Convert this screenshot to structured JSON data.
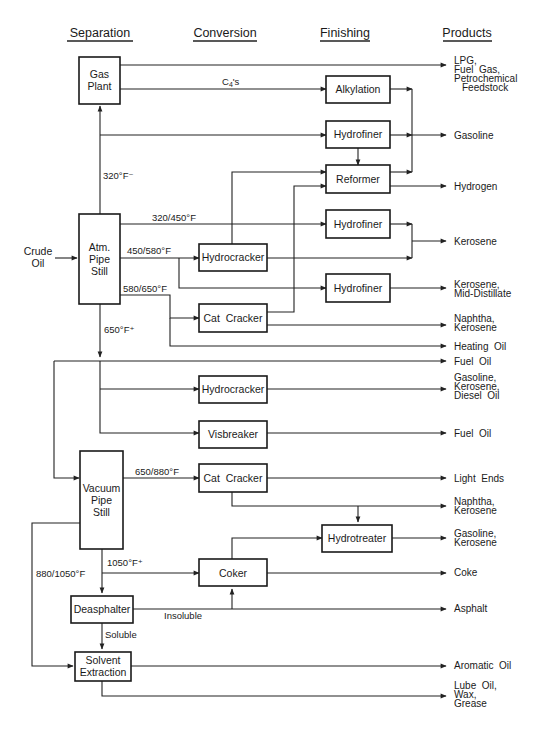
{
  "diagram": {
    "columns": {
      "separation": "Separation",
      "conversion": "Conversion",
      "finishing": "Finishing",
      "products": "Products"
    },
    "feed": {
      "line1": "Crude",
      "line2": "Oil"
    },
    "separation_units": {
      "gas_plant": {
        "line1": "Gas",
        "line2": "Plant"
      },
      "atm_pipe_still": {
        "line1": "Atm.",
        "line2": "Pipe",
        "line3": "Still"
      },
      "vacuum_pipe_still": {
        "line1": "Vacuum",
        "line2": "Pipe",
        "line3": "Still"
      },
      "deasphalter": {
        "label": "Deasphalter"
      },
      "solvent_extraction": {
        "line1": "Solvent",
        "line2": "Extraction"
      }
    },
    "conversion_units": {
      "hydrocracker_1": "Hydrocracker",
      "cat_cracker_1": "Cat  Cracker",
      "hydrocracker_2": "Hydrocracker",
      "visbreaker": "Visbreaker",
      "cat_cracker_2": "Cat  Cracker",
      "coker": "Coker"
    },
    "finishing_units": {
      "alkylation": "Alkylation",
      "hydrofiner_1": "Hydrofiner",
      "reformer": "Reformer",
      "hydrofiner_2": "Hydrofiner",
      "hydrofiner_3": "Hydrofiner",
      "hydrotreater": "Hydrotreater"
    },
    "stream_labels": {
      "c4s_base": "C",
      "c4s_sub": "4",
      "c4s_tail": "'s",
      "cut_320_minus": "320°F⁻",
      "cut_320_450": "320/450°F",
      "cut_450_580": "450/580°F",
      "cut_580_650": "580/650°F",
      "cut_650_plus": "650°F⁺",
      "cut_650_880": "650/880°F",
      "cut_1050_plus": "1050°F⁺",
      "cut_880_1050": "880/1050°F",
      "insoluble": "Insoluble",
      "soluble": "Soluble"
    },
    "products": {
      "lpg": [
        "LPG,",
        "Fuel  Gas,",
        "Petrochemical",
        "Feedstock"
      ],
      "gasoline_1": [
        "Gasoline"
      ],
      "hydrogen": [
        "Hydrogen"
      ],
      "kerosene_1": [
        "Kerosene"
      ],
      "kerosene_mid": [
        "Kerosene,",
        "Mid-Distillate"
      ],
      "naphtha_kero_1": [
        "Naphtha,",
        "Kerosene"
      ],
      "heating_oil": [
        "Heating  Oil"
      ],
      "fuel_oil_1": [
        "Fuel  Oil"
      ],
      "gas_kero_diesel": [
        "Gasoline,",
        "Kerosene,",
        "Diesel  Oil"
      ],
      "fuel_oil_2": [
        "Fuel  Oil"
      ],
      "light_ends": [
        "Light  Ends"
      ],
      "naphtha_kero_2": [
        "Naphtha,",
        "Kerosene"
      ],
      "gas_kero": [
        "Gasoline,",
        "Kerosene"
      ],
      "coke": [
        "Coke"
      ],
      "asphalt": [
        "Asphalt"
      ],
      "aromatic_oil": [
        "Aromatic  Oil"
      ],
      "lube": [
        "Lube  Oil,",
        "Wax,",
        "Grease"
      ]
    }
  }
}
